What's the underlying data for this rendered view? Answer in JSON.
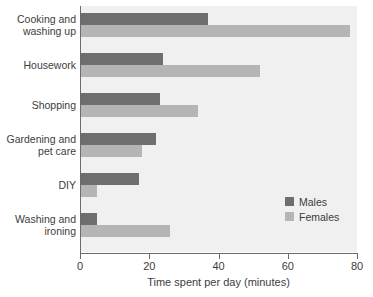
{
  "chart_data": {
    "type": "bar",
    "orientation": "horizontal",
    "title": "",
    "xlabel": "Time spent per day (minutes)",
    "ylabel": "",
    "xlim": [
      0,
      80
    ],
    "xticks": [
      0,
      20,
      40,
      60,
      80
    ],
    "xtick_labels": [
      "0",
      "20",
      "40",
      "60",
      "80"
    ],
    "grid": false,
    "legend_position": "bottom-right",
    "categories": [
      "Cooking and washing up",
      "Housework",
      "Shopping",
      "Gardening and pet care",
      "DIY",
      "Washing and ironing"
    ],
    "category_label_lines": [
      [
        "Cooking and",
        "washing up"
      ],
      [
        "Housework"
      ],
      [
        "Shopping"
      ],
      [
        "Gardening and",
        "pet care"
      ],
      [
        "DIY"
      ],
      [
        "Washing and",
        "ironing"
      ]
    ],
    "series": [
      {
        "name": "Males",
        "color": "#6e6e6e",
        "values": [
          37,
          24,
          23,
          22,
          17,
          5
        ]
      },
      {
        "name": "Females",
        "color": "#b5b5b5",
        "values": [
          78,
          52,
          34,
          18,
          5,
          26
        ]
      }
    ]
  },
  "legend": {
    "items": [
      {
        "label": "Males",
        "color": "#6e6e6e"
      },
      {
        "label": "Females",
        "color": "#b5b5b5"
      }
    ]
  },
  "colors": {
    "plot_background": "#f0f0f0",
    "axis": "#6b6b6b",
    "text": "#3d3d3d",
    "males": "#6e6e6e",
    "females": "#b5b5b5"
  }
}
